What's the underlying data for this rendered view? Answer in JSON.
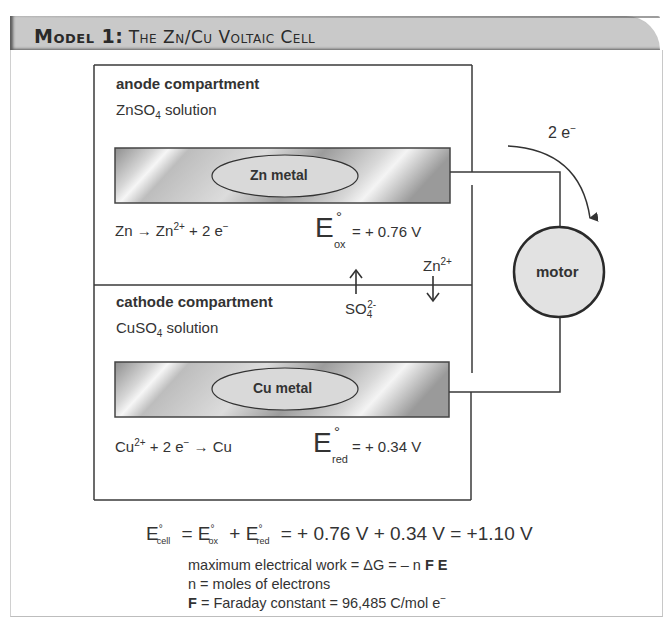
{
  "header": {
    "model_label": "Model 1:",
    "title": "The Zn/Cu Voltaic Cell"
  },
  "anode": {
    "heading": "anode compartment",
    "solution_prefix": "ZnSO",
    "solution_sub": "4",
    "solution_suffix": " solution",
    "metal_label": "Zn metal",
    "reaction": {
      "lhs": "Zn",
      "arrow": "→",
      "product": "Zn",
      "product_charge": "2+",
      "rest": " + 2 e",
      "electron_charge": "−"
    },
    "potential": {
      "symbol": "E",
      "degree": "°",
      "subscript": "ox",
      "value": "= + 0.76 V"
    }
  },
  "cathode": {
    "heading": "cathode compartment",
    "solution_prefix": "CuSO",
    "solution_sub": "4",
    "solution_suffix": " solution",
    "metal_label": "Cu metal",
    "reaction": {
      "reactant": "Cu",
      "reactant_charge": "2+",
      "rest": " + 2 e",
      "electron_charge": "−",
      "arrow": "→",
      "product": "Cu"
    },
    "potential": {
      "symbol": "E",
      "degree": "°",
      "subscript": "red",
      "value": "= + 0.34 V"
    }
  },
  "ion_flow": {
    "sulfate": {
      "base": "SO",
      "sub": "4",
      "charge": "2-",
      "direction": "up"
    },
    "zinc": {
      "base": "Zn",
      "charge": "2+",
      "direction": "down"
    }
  },
  "circuit": {
    "electron_label": "2 e",
    "electron_charge": "−",
    "motor_label": "motor"
  },
  "equation": {
    "e_cell": "E",
    "e_cell_sub": "cell",
    "e_ox_sub": "ox",
    "e_red_sub": "red",
    "degree": "°",
    "plus": " + ",
    "equals": " = ",
    "result": "= + 0.76 V + 0.34 V = +1.10 V"
  },
  "notes": {
    "line1_text": "maximum electrical work = ΔG = – n ",
    "line1_bold": "F E",
    "line2": "n = moles of electrons",
    "line3_bold": "F",
    "line3_text": " = Faraday constant = 96,485 C/mol e",
    "line3_charge": "−"
  },
  "colors": {
    "header_band": "#c9c9c9",
    "line": "#3a3a3a",
    "motor_fill": "#e2e2e2",
    "metal_dark": "#8e8e8e",
    "metal_light": "#f2f2f2"
  }
}
